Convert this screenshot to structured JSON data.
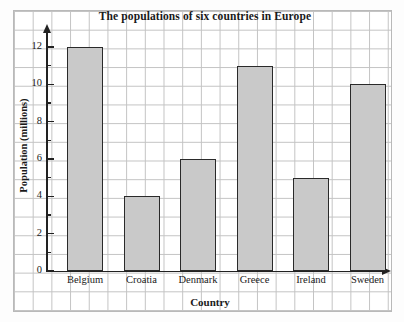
{
  "chart_data": {
    "type": "bar",
    "title": "The populations of six countries in Europe",
    "xlabel": "Country",
    "ylabel": "Population (millions)",
    "categories": [
      "Belgium",
      "Croatia",
      "Denmark",
      "Greece",
      "Ireland",
      "Sweden"
    ],
    "values": [
      12,
      4,
      6,
      11,
      5,
      10
    ],
    "ylim": [
      0,
      12
    ],
    "y_major_ticks": [
      0,
      2,
      4,
      6,
      8,
      10,
      12
    ],
    "y_minor_ticks": [
      1,
      3,
      5,
      7,
      9,
      11
    ],
    "y_tick_labels": [
      "0",
      "2",
      "4",
      "6",
      "8",
      "10",
      "12"
    ],
    "grid": "graph-paper",
    "legend": "none",
    "bar_fill_color": "#c9c9c9",
    "bar_edge_color": "#2a2a2a",
    "axis_color": "#222222",
    "grid_color": "#c3c3c3"
  }
}
